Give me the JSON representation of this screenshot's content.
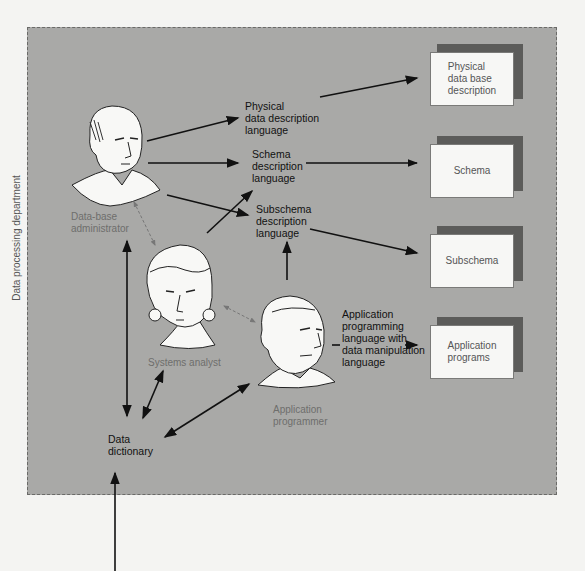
{
  "department": {
    "label": "Data processing department"
  },
  "roles": {
    "dba": "Data-base\nadministrator",
    "analyst": "Systems analyst",
    "programmer": "Application\nprogrammer"
  },
  "languages": {
    "physical": "Physical\ndata description\nlanguage",
    "schema": "Schema\ndescription\nlanguage",
    "subschema": "Subschema\ndescription\nlanguage",
    "application": "Application\nprogramming\nlanguage with\ndata manipulation\nlanguage"
  },
  "outputs": {
    "physical": "Physical\ndata base\ndescription",
    "schema": "Schema",
    "subschema": "Subschema",
    "application": "Application\nprograms"
  },
  "dictionary": {
    "label": "Data\ndictionary"
  },
  "colors": {
    "department_fill": "#a9a9a7",
    "box_fill": "#f7f7f5",
    "box_shadow": "#5c5c5a",
    "arrow": "#111111"
  }
}
